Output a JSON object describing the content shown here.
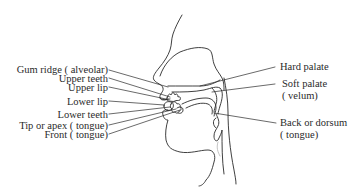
{
  "diagram": {
    "colors": {
      "ink": "#2a2a2a",
      "background": "#ffffff"
    },
    "left_labels": [
      {
        "id": "gum-ridge",
        "text": "Gum ridge ( alveolar)"
      },
      {
        "id": "upper-teeth",
        "text": "Upper teeth"
      },
      {
        "id": "upper-lip",
        "text": "Upper lip"
      },
      {
        "id": "lower-lip",
        "text": "Lower lip"
      },
      {
        "id": "lower-teeth",
        "text": "Lower teeth"
      },
      {
        "id": "tip-apex",
        "text": "Tip or apex ( tongue)"
      },
      {
        "id": "front-tongue",
        "text": "Front ( tongue)"
      }
    ],
    "right_labels": [
      {
        "id": "hard-palate",
        "line1": "Hard palate",
        "line2": ""
      },
      {
        "id": "soft-palate",
        "line1": "Soft palate",
        "line2": "( velum)"
      },
      {
        "id": "back-dorsum",
        "line1": "Back or dorsum",
        "line2": "( tongue)"
      }
    ]
  }
}
